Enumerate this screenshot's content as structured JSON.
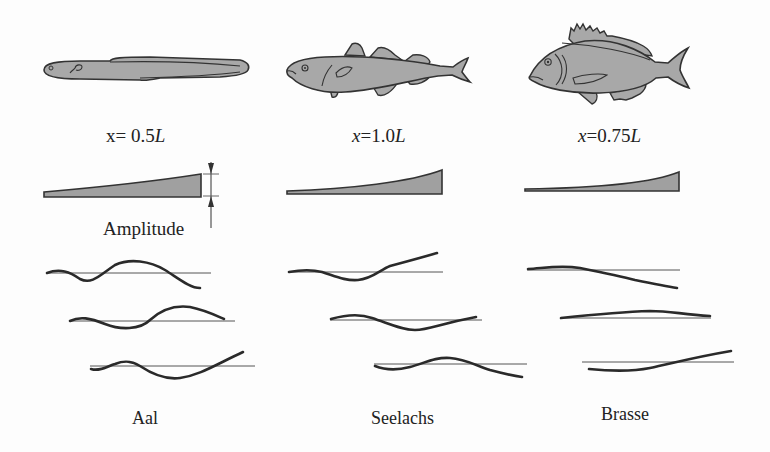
{
  "figure": {
    "columns": [
      {
        "species": "Aal",
        "position_label_prefix": "x= 0.5",
        "position_label_var": "L",
        "fish_icon": "eel-icon",
        "amplitude_profile": "linear-taper",
        "waves": 3
      },
      {
        "species": "Seelachs",
        "position_label_prefix": "x=1.0",
        "position_label_var": "L",
        "fish_icon": "pollock-icon",
        "amplitude_profile": "exponential-taper",
        "waves": 3
      },
      {
        "species": "Brasse",
        "position_label_prefix": "x=0.75",
        "position_label_var": "L",
        "fish_icon": "bream-icon",
        "amplitude_profile": "steep-exponential-taper",
        "waves": 3
      }
    ],
    "amplitude_label": "Amplitude",
    "colors": {
      "fish_fill": "#a8a8a8",
      "outline": "#333333",
      "envelope_fill": "#a0a0a0",
      "wave_stroke": "#2a2a2a",
      "axis_line": "#555555"
    }
  }
}
